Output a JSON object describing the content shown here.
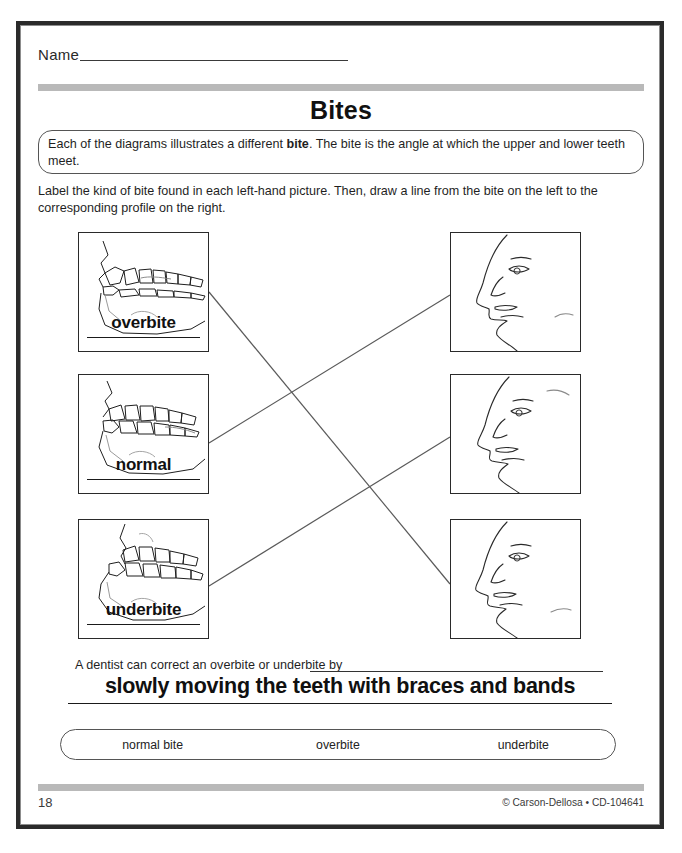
{
  "page": {
    "title": "Bites",
    "name_label": "Name",
    "intro_before": "Each of the diagrams illustrates a different ",
    "intro_bold": "bite",
    "intro_after": ". The bite is the angle at which the upper and lower teeth meet.",
    "directions": "Label the kind of bite found in each left-hand picture. Then, draw a line from the bite on the left to the corresponding profile on the right."
  },
  "bite_items": [
    {
      "answer": "overbite",
      "icon": "jaw-overbite-icon"
    },
    {
      "answer": "normal",
      "icon": "jaw-normal-icon"
    },
    {
      "answer": "underbite",
      "icon": "jaw-underbite-icon"
    }
  ],
  "profile_items": [
    {
      "icon": "face-profile-icon"
    },
    {
      "icon": "face-profile-icon"
    },
    {
      "icon": "face-profile-icon"
    }
  ],
  "sentence": {
    "text": "A dentist can correct an overbite or underbite by",
    "written_answer": "slowly moving the teeth with braces and bands"
  },
  "word_bank": {
    "options": [
      "normal bite",
      "overbite",
      "underbite"
    ]
  },
  "footer": {
    "page_number": "18",
    "credit": "© Carson-Dellosa • CD-104641"
  },
  "colors": {
    "frame": "#2b2b2b",
    "bar": "#b9b9b9",
    "ink": "#1a1a1a"
  }
}
